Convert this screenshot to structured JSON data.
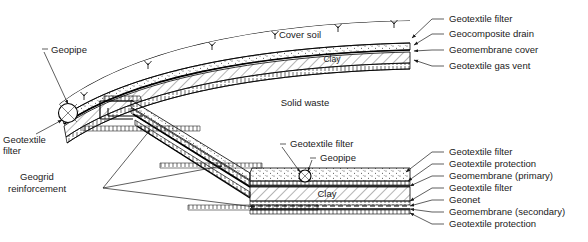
{
  "figure": {
    "title": "",
    "type": "engineering-cross-section"
  },
  "interior_labels": {
    "cover_soil": "Cover soil",
    "solid_waste": "Solid waste",
    "clay_cover": "Clay",
    "clay_base": "Clay",
    "geopipe_top": "Geopipe"
  },
  "left_labels": {
    "geotextile_filter_line1": "Geotextile",
    "geotextile_filter_line2": "filter",
    "geogrid_line1": "Geogrid",
    "geogrid_line2": "reinforcement"
  },
  "center_labels": {
    "geotextile_filter": "Geotextile filter",
    "geopipe": "Geopipe"
  },
  "cover_callouts": [
    "Geotextile filter",
    "Geocomposite drain",
    "Geomembrane cover",
    "Geotextile gas vent"
  ],
  "liner_callouts": [
    "Geotextile filter",
    "Geotextile protection",
    "Geomembrane (primary)",
    "Geotextile filter",
    "Geonet",
    "Geomembrane (secondary)",
    "Geotextile protection"
  ],
  "colors": {
    "ink": "#1a1a1a",
    "line": "#000000",
    "background": "#ffffff",
    "fill_clay": "#ffffff",
    "fill_drain": "#ffffff"
  }
}
